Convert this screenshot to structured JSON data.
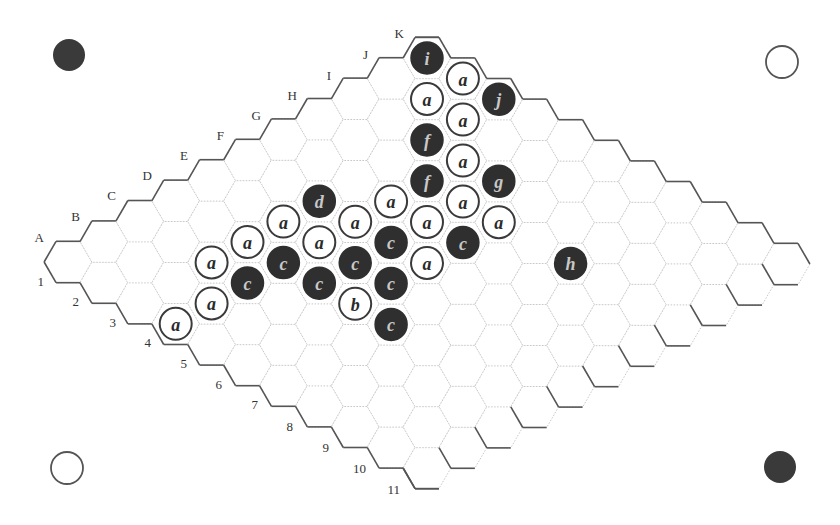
{
  "board": {
    "size": 11,
    "columns": [
      "A",
      "B",
      "C",
      "D",
      "E",
      "F",
      "G",
      "H",
      "I",
      "J",
      "K"
    ],
    "rows": [
      "1",
      "2",
      "3",
      "4",
      "5",
      "6",
      "7",
      "8",
      "9",
      "10",
      "11"
    ],
    "geometry": {
      "origin": [
        68,
        262
      ],
      "col_step": [
        35.9,
        -20.4
      ],
      "row_step": [
        35.9,
        20.6
      ],
      "hex_radius": 23.9
    },
    "column_label_positions": [
      [
        44,
        242
      ],
      [
        80,
        221
      ],
      [
        116,
        200
      ],
      [
        152,
        180
      ],
      [
        188,
        160
      ],
      [
        224,
        140
      ],
      [
        261,
        120
      ],
      [
        297,
        100
      ],
      [
        331,
        80
      ],
      [
        368,
        59
      ],
      [
        404,
        38
      ]
    ],
    "row_label_positions": [
      [
        44,
        286
      ],
      [
        79,
        306
      ],
      [
        116,
        327
      ],
      [
        151,
        347
      ],
      [
        187,
        368
      ],
      [
        222,
        389
      ],
      [
        258,
        409
      ],
      [
        293,
        431
      ],
      [
        329,
        452
      ],
      [
        366,
        473
      ],
      [
        400,
        494
      ]
    ]
  },
  "stones": [
    {
      "cell": "A4",
      "color": "white",
      "label": "a"
    },
    {
      "cell": "B4",
      "color": "white",
      "label": "a"
    },
    {
      "cell": "C3",
      "color": "white",
      "label": "a"
    },
    {
      "cell": "C4",
      "color": "black",
      "label": "c"
    },
    {
      "cell": "D3",
      "color": "white",
      "label": "a"
    },
    {
      "cell": "D4",
      "color": "black",
      "label": "c"
    },
    {
      "cell": "E3",
      "color": "white",
      "label": "a"
    },
    {
      "cell": "F3",
      "color": "black",
      "label": "d"
    },
    {
      "cell": "E4",
      "color": "white",
      "label": "a"
    },
    {
      "cell": "D5",
      "color": "black",
      "label": "c"
    },
    {
      "cell": "F4",
      "color": "white",
      "label": "a"
    },
    {
      "cell": "E5",
      "color": "black",
      "label": "c"
    },
    {
      "cell": "D6",
      "color": "white",
      "label": "b"
    },
    {
      "cell": "G4",
      "color": "white",
      "label": "a"
    },
    {
      "cell": "F5",
      "color": "black",
      "label": "c"
    },
    {
      "cell": "E6",
      "color": "black",
      "label": "c"
    },
    {
      "cell": "D7",
      "color": "black",
      "label": "c"
    },
    {
      "cell": "G5",
      "color": "white",
      "label": "a"
    },
    {
      "cell": "F6",
      "color": "white",
      "label": "a"
    },
    {
      "cell": "H4",
      "color": "black",
      "label": "f"
    },
    {
      "cell": "I3",
      "color": "black",
      "label": "f"
    },
    {
      "cell": "J2",
      "color": "white",
      "label": "a"
    },
    {
      "cell": "K1",
      "color": "black",
      "label": "i"
    },
    {
      "cell": "K2",
      "color": "white",
      "label": "a"
    },
    {
      "cell": "J3",
      "color": "white",
      "label": "a"
    },
    {
      "cell": "I4",
      "color": "white",
      "label": "a"
    },
    {
      "cell": "H5",
      "color": "white",
      "label": "a"
    },
    {
      "cell": "G6",
      "color": "black",
      "label": "c"
    },
    {
      "cell": "K3",
      "color": "black",
      "label": "j"
    },
    {
      "cell": "I5",
      "color": "black",
      "label": "g"
    },
    {
      "cell": "H6",
      "color": "white",
      "label": "a"
    },
    {
      "cell": "H8",
      "color": "black",
      "label": "h"
    }
  ],
  "corner_markers": [
    {
      "position": "top-left",
      "color": "black",
      "center": [
        69,
        55
      ],
      "radius": 16
    },
    {
      "position": "top-right",
      "color": "white",
      "center": [
        782,
        62
      ],
      "radius": 16
    },
    {
      "position": "bottom-left",
      "color": "white",
      "center": [
        67,
        468
      ],
      "radius": 16
    },
    {
      "position": "bottom-right",
      "color": "black",
      "center": [
        780,
        467
      ],
      "radius": 16
    }
  ],
  "colors": {
    "black_stone": "#2f2f2f",
    "white_stone": "#ffffff",
    "edge": "#555555",
    "grid": "#c8c8c8"
  }
}
